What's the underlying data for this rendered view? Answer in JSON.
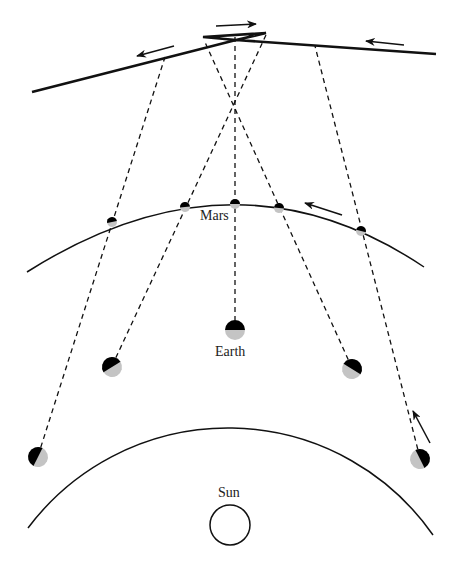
{
  "labels": {
    "mars": "Mars",
    "earth": "Earth",
    "sun": "Sun"
  },
  "colors": {
    "line": "#111111",
    "planet_dark": "#000000",
    "planet_lit": "#bdbdbd",
    "background": "#ffffff"
  },
  "earth_positions": [
    {
      "x": 38,
      "y": 456
    },
    {
      "x": 112,
      "y": 366
    },
    {
      "x": 235,
      "y": 330
    },
    {
      "x": 352,
      "y": 368
    },
    {
      "x": 420,
      "y": 458
    }
  ],
  "mars_positions": [
    {
      "x": 112,
      "y": 222
    },
    {
      "x": 185,
      "y": 207
    },
    {
      "x": 235,
      "y": 204
    },
    {
      "x": 279,
      "y": 208
    },
    {
      "x": 361,
      "y": 231
    }
  ],
  "apparent_path_points": [
    {
      "x": 32,
      "y": 92
    },
    {
      "x": 236,
      "y": 40
    },
    {
      "x": 203,
      "y": 37
    },
    {
      "x": 266,
      "y": 33
    },
    {
      "x": 236,
      "y": 40
    },
    {
      "x": 436,
      "y": 54
    }
  ],
  "arrows": [
    {
      "name": "apparent-motion-left",
      "direction": "left"
    },
    {
      "name": "apparent-motion-retrograde",
      "direction": "right"
    },
    {
      "name": "apparent-motion-right-incoming",
      "direction": "left"
    },
    {
      "name": "mars-orbit-direction",
      "direction": "left"
    },
    {
      "name": "earth-orbit-direction",
      "direction": "up"
    }
  ]
}
